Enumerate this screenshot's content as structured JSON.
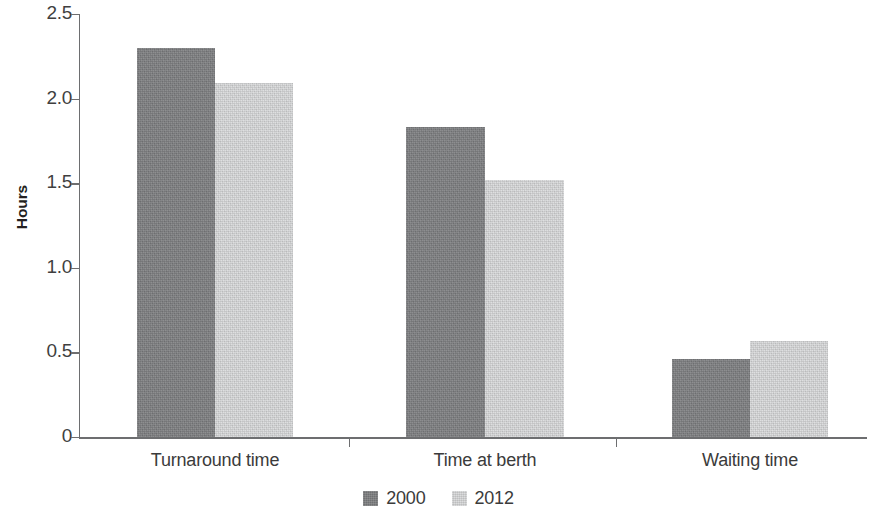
{
  "chart_data": {
    "type": "bar",
    "title": "",
    "subtitle": "",
    "xlabel": "",
    "ylabel": "Hours",
    "categories": [
      "Turnaround time",
      "Time at berth",
      "Waiting time"
    ],
    "series": [
      {
        "name": "2000",
        "color": "#7c7d7f",
        "values": [
          2.3,
          1.83,
          0.46
        ]
      },
      {
        "name": "2012",
        "color": "#d3d4d5",
        "values": [
          2.09,
          1.52,
          0.57
        ]
      }
    ],
    "ylim": [
      0,
      2.5
    ],
    "ytick_labels": [
      "2.5",
      "2.0",
      "1.5",
      "1.0",
      "0.5",
      "0"
    ],
    "ytick_values": [
      2.5,
      2.0,
      1.5,
      1.0,
      0.5,
      0
    ],
    "grid": false,
    "legend_position": "bottom",
    "legend_entries": [
      "2000",
      "2012"
    ],
    "annotations": []
  }
}
